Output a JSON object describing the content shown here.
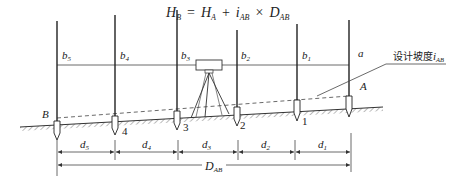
{
  "formula": {
    "lhs": "H",
    "lhs_sub": "B",
    "eq": "=",
    "term1": "H",
    "term1_sub": "A",
    "plus": "+",
    "term2": "i",
    "term2_sub": "AB",
    "times": "×",
    "term3": "D",
    "term3_sub": "AB"
  },
  "readings": [
    {
      "base": "b",
      "sub": "5"
    },
    {
      "base": "b",
      "sub": "4"
    },
    {
      "base": "b",
      "sub": "3"
    },
    {
      "base": "b",
      "sub": "2"
    },
    {
      "base": "b",
      "sub": "1"
    },
    {
      "base": "a",
      "sub": ""
    }
  ],
  "points": {
    "B": "B",
    "A": "A",
    "p4": "4",
    "p3": "3",
    "p2": "2",
    "p1": "1"
  },
  "slope_label": {
    "text": "设计坡度",
    "var": "i",
    "sub": "AB"
  },
  "distances": [
    {
      "base": "d",
      "sub": "5"
    },
    {
      "base": "d",
      "sub": "4"
    },
    {
      "base": "d",
      "sub": "3"
    },
    {
      "base": "d",
      "sub": "2"
    },
    {
      "base": "d",
      "sub": "1"
    }
  ],
  "total_distance": {
    "base": "D",
    "sub": "AB"
  }
}
